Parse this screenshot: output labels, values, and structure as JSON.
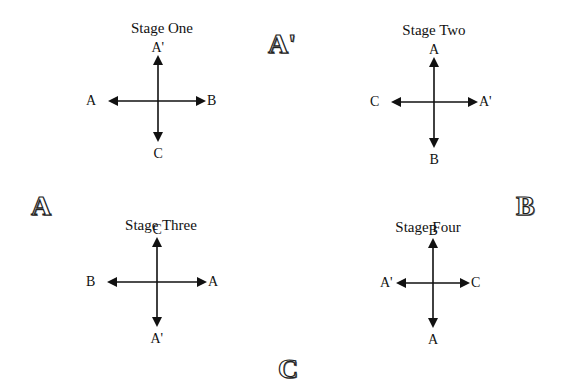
{
  "diagram": {
    "corner_labels": [
      {
        "text": "A'",
        "x": 279,
        "y": 31,
        "size": 26
      },
      {
        "text": "A",
        "x": 32,
        "y": 196,
        "size": 26,
        "note": "left",
        "anchor_y": 196
      },
      {
        "text": "B",
        "x": 514,
        "y": 196,
        "size": 26
      },
      {
        "text": "C",
        "x": 278,
        "y": 360,
        "size": 26
      }
    ],
    "stages": [
      {
        "title": "Stage One",
        "title_x": 162,
        "title_y": 21,
        "center": [
          158,
          101
        ],
        "left_tip": 108,
        "right_tip": 206,
        "top_tip": 55,
        "bottom_tip": 142,
        "labels": {
          "top": "A'",
          "bottom": "C",
          "left": "A",
          "right": "B"
        }
      },
      {
        "title": "Stage Two",
        "title_x": 434,
        "title_y": 23,
        "center": [
          434,
          102
        ],
        "left_tip": 391,
        "right_tip": 478,
        "top_tip": 57,
        "bottom_tip": 148,
        "labels": {
          "top": "A",
          "bottom": "B",
          "left": "C",
          "right": "A'"
        }
      },
      {
        "title": "Stage Three",
        "title_x": 161,
        "title_y": 218,
        "center": [
          157,
          282
        ],
        "left_tip": 107,
        "right_tip": 207,
        "top_tip": 237,
        "bottom_tip": 327,
        "labels": {
          "top": "C",
          "bottom": "A'",
          "left": "B",
          "right": "A"
        }
      },
      {
        "title": "Stage Four",
        "title_x": 428,
        "title_y": 220,
        "center": [
          433,
          283
        ],
        "left_tip": 396,
        "right_tip": 470,
        "top_tip": 238,
        "bottom_tip": 328,
        "labels": {
          "top": "B",
          "bottom": "A",
          "left": "A'",
          "right": "C"
        }
      }
    ]
  }
}
